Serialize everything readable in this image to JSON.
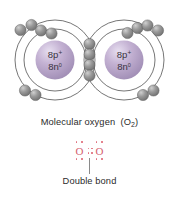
{
  "figure": {
    "background_color": "#ffffff"
  },
  "atoms": [
    {
      "id": "left-oxygen",
      "nucleus_protons_label": "8p",
      "nucleus_protons_charge": "+",
      "nucleus_neutrons_label": "8n",
      "nucleus_neutrons_charge": "0",
      "nucleus_color": "#b9a7c8",
      "shells": 2,
      "inner_shell_electrons": 2,
      "outer_shell_electrons": 6
    },
    {
      "id": "right-oxygen",
      "nucleus_protons_label": "8p",
      "nucleus_protons_charge": "+",
      "nucleus_neutrons_label": "8n",
      "nucleus_neutrons_charge": "0",
      "nucleus_color": "#b9a7c8",
      "shells": 2,
      "inner_shell_electrons": 2,
      "outer_shell_electrons": 6
    }
  ],
  "shared_electrons": {
    "count": 4,
    "description": "shared electron pairs forming the double bond"
  },
  "electron_color": "#8d8d8d",
  "shell_line_color": "#3b3b3b",
  "labels": {
    "molecule_caption": "Molecular oxygen",
    "molecule_formula_open": "(O",
    "molecule_formula_sub": "2",
    "molecule_formula_close": ")",
    "bond_caption": "Double bond"
  },
  "lewis_structure": {
    "left_atom_symbol": "O",
    "right_atom_symbol": "O",
    "atom_color": "#d4606e",
    "bonding_pairs": 2,
    "lone_pairs_per_atom": 2
  }
}
